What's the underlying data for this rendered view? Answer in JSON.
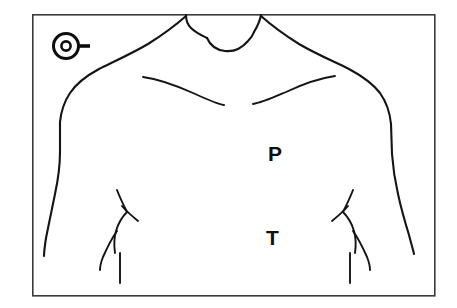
{
  "figure": {
    "type": "line-drawing",
    "background_color": "#ffffff",
    "line_color": "#141414",
    "frame_color": "#3a3a3a"
  },
  "frame": {
    "x": 32,
    "y": 14,
    "width": 403,
    "height": 282
  },
  "markers": {
    "electrode": {
      "name": "electrode-marker",
      "shape": "circle-with-center-dot-and-lead",
      "x": 66,
      "y": 46,
      "outer_radius": 13,
      "inner_radius": 5,
      "lead_direction": "right"
    }
  },
  "labels": [
    {
      "id": "p",
      "text": "P",
      "x": 275,
      "y": 155,
      "description": "Pulmonic area auscultation site"
    },
    {
      "id": "t",
      "text": "T",
      "x": 273,
      "y": 238,
      "description": "Tricuspid area auscultation site"
    }
  ],
  "anatomy": {
    "parts": [
      "neck-left",
      "neck-right",
      "suprasternal-notch",
      "shoulder-left",
      "shoulder-right",
      "arm-left",
      "arm-right",
      "clavicle-left",
      "clavicle-right",
      "costal-margin-left",
      "costal-margin-right"
    ]
  }
}
